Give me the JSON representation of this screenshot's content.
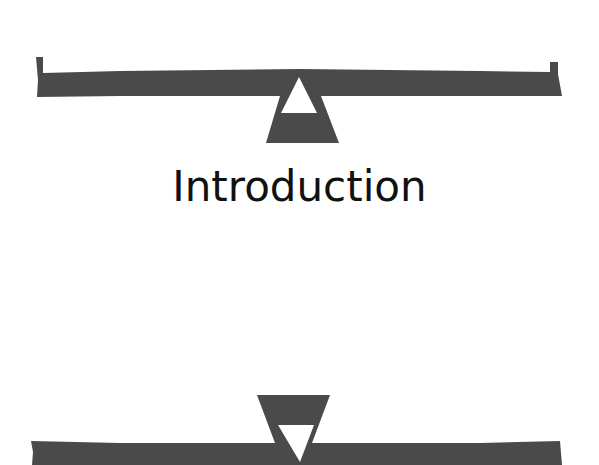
{
  "page": {
    "heading": "Introduction"
  },
  "ornament": {
    "fill_color": "#4a4a4a",
    "cutout_color": "#ffffff",
    "top_ornament": "balance-scale-upright",
    "bottom_ornament": "balance-scale-inverted"
  }
}
